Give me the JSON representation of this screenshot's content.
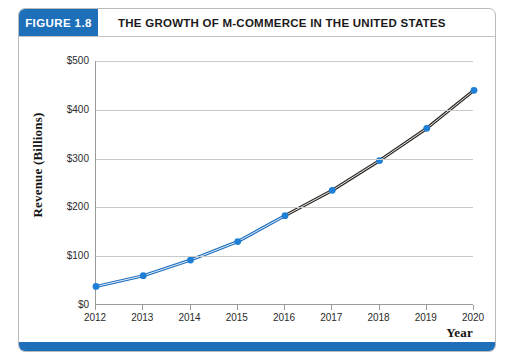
{
  "figure": {
    "number_label": "FIGURE 1.8",
    "title": "THE GROWTH OF M-COMMERCE IN THE UNITED STATES",
    "accent_color": "#1d6fba",
    "header_text_color": "#ffffff",
    "title_text_color": "#1a1a1a"
  },
  "chart_data": {
    "type": "line",
    "title": "THE GROWTH OF M-COMMERCE IN THE UNITED STATES",
    "xlabel": "Year",
    "ylabel": "Revenue (Billions)",
    "categories": [
      "2012",
      "2013",
      "2014",
      "2015",
      "2016",
      "2017",
      "2018",
      "2019",
      "2020"
    ],
    "x": [
      2012,
      2013,
      2014,
      2015,
      2016,
      2017,
      2018,
      2019,
      2020
    ],
    "values": [
      38,
      60,
      92,
      130,
      183,
      235,
      296,
      362,
      440
    ],
    "ylim": [
      0,
      500
    ],
    "xlim": [
      2012,
      2020
    ],
    "y_ticks": [
      0,
      100,
      200,
      300,
      400,
      500
    ],
    "y_tick_labels": [
      "$0",
      "$100",
      "$200",
      "$300",
      "$400",
      "$500"
    ],
    "x_tick_labels": [
      "2012",
      "2013",
      "2014",
      "2015",
      "2016",
      "2017",
      "2018",
      "2019",
      "2020"
    ],
    "grid": true,
    "grid_axis": "y",
    "grid_color": "#c9c9c9",
    "legend": "none",
    "series": [
      {
        "name": "Actual",
        "segment_years": [
          "2012",
          "2013",
          "2014",
          "2015",
          "2016"
        ],
        "segment_values": [
          38,
          60,
          92,
          130,
          183
        ],
        "line_color": "#1f6fbf"
      },
      {
        "name": "Projected",
        "segment_years": [
          "2016",
          "2017",
          "2018",
          "2019",
          "2020"
        ],
        "segment_values": [
          183,
          235,
          296,
          362,
          440
        ],
        "line_color": "#2e2a26"
      }
    ],
    "marker_color": "#1f7fd4",
    "marker_shape": "circle",
    "axis_color": "#9a9a9a"
  },
  "footer": {
    "bar_color": "#1d6fba"
  }
}
